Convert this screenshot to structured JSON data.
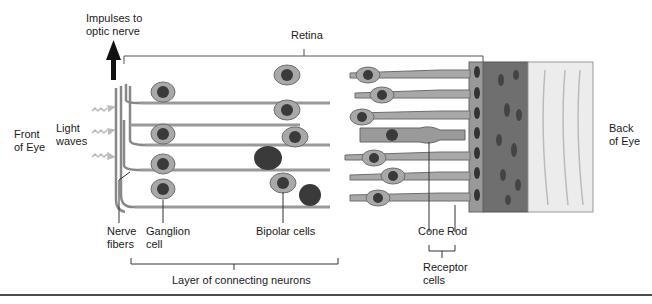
{
  "diagram": {
    "title": "Retina",
    "labels": {
      "impulses": [
        "Impulses to",
        "optic nerve"
      ],
      "retina": "Retina",
      "front_of_eye": [
        "Front",
        "of Eye"
      ],
      "light_waves": [
        "Light",
        "waves"
      ],
      "back_of_eye": [
        "Back",
        "of Eye"
      ],
      "nerve_fibers": [
        "Nerve",
        "fibers"
      ],
      "ganglion_cell": [
        "Ganglion",
        "cell"
      ],
      "bipolar_cells": "Bipolar cells",
      "cone": "Cone",
      "rod": "Rod",
      "receptor_cells": [
        "Receptor",
        "cells"
      ],
      "layer_of_connecting_neurons": "Layer of connecting neurons"
    },
    "colors": {
      "cell_fill": "#a8a8a8",
      "cell_stroke": "#6e6e6e",
      "nucleus": "#3a3a3a",
      "pigment_layer": "#6f6f6f",
      "choroid": "#e6e6e6",
      "line": "#333333"
    }
  }
}
